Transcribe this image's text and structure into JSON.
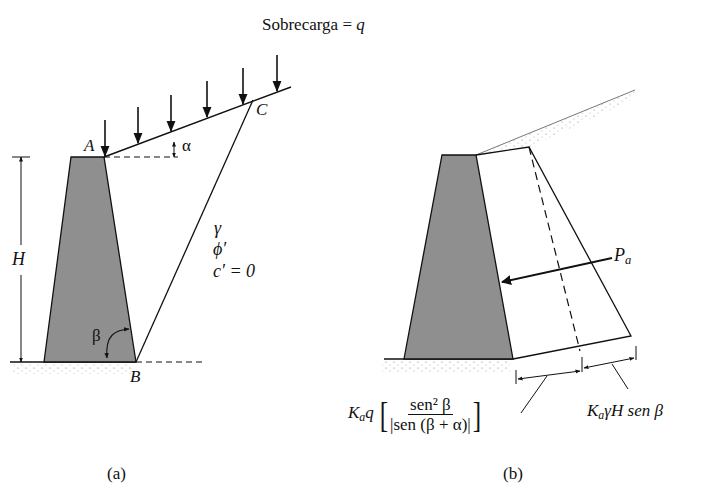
{
  "title": {
    "prefix": "Sobrecarga = ",
    "symbol": "q"
  },
  "panel_a": {
    "caption": "(a)",
    "points": {
      "A": "A",
      "B": "B",
      "C": "C"
    },
    "height_label": "H",
    "angle_alpha": "α",
    "angle_beta": "β",
    "soil_props": {
      "unit_weight": "γ",
      "friction": "ϕ′",
      "cohesion": "c′ = 0"
    }
  },
  "panel_b": {
    "caption": "(b)",
    "force_label": {
      "main": "P",
      "sub": "a"
    },
    "top_pressure": {
      "K": "K",
      "K_sub": "a",
      "q": "q",
      "numerator": "sen² β",
      "denominator": "|sen (β + α)|"
    },
    "bottom_pressure": {
      "K": "K",
      "K_sub": "a",
      "rest": "γH sen β"
    }
  },
  "colors": {
    "wall_fill": "#8f8f8f",
    "line": "#111111",
    "background": "#ffffff"
  }
}
